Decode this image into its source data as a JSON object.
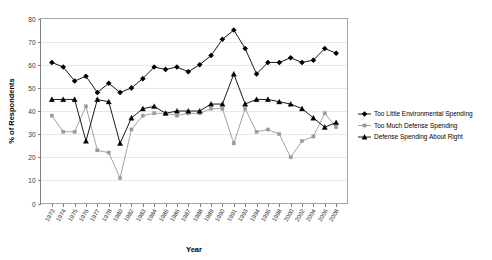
{
  "chart_data": {
    "type": "line",
    "title": "",
    "xlabel": "Year",
    "ylabel": "% of Respondents",
    "ylim": [
      0,
      80
    ],
    "yticks": [
      0,
      10,
      20,
      30,
      40,
      50,
      60,
      70,
      80
    ],
    "grid": true,
    "legend_position": "right",
    "categories": [
      "1973",
      "1974",
      "1975",
      "1976",
      "1977",
      "1978",
      "1980",
      "1982",
      "1983",
      "1984",
      "1985",
      "1986",
      "1987",
      "1988",
      "1989",
      "1990",
      "1991",
      "1993",
      "1994",
      "1996",
      "1998",
      "2000",
      "2002",
      "2004",
      "2006",
      "2008"
    ],
    "series": [
      {
        "name": "Too Little Environmental Spending",
        "marker": "diamond",
        "color": "#000000",
        "values": [
          61,
          59,
          53,
          55,
          48,
          52,
          48,
          50,
          54,
          59,
          58,
          59,
          57,
          60,
          64,
          71,
          75,
          67,
          56,
          61,
          61,
          63,
          61,
          62,
          67,
          65
        ]
      },
      {
        "name": "Too Much Defense Spending",
        "marker": "square",
        "color": "#999999",
        "values": [
          38,
          31,
          31,
          42,
          23,
          22,
          11,
          32,
          38,
          39,
          39,
          38,
          39,
          39,
          41,
          41,
          26,
          41,
          31,
          32,
          30,
          20,
          27,
          29,
          39,
          33
        ]
      },
      {
        "name": "Defense Spending About Right",
        "marker": "triangle",
        "color": "#000000",
        "values": [
          45,
          45,
          45,
          27,
          45,
          44,
          26,
          37,
          41,
          42,
          39,
          40,
          40,
          40,
          43,
          43,
          56,
          43,
          45,
          45,
          44,
          43,
          41,
          37,
          33,
          35
        ]
      }
    ]
  },
  "legend": {
    "items": [
      {
        "label": "Too Little Environmental Spending"
      },
      {
        "label": "Too Much Defense Spending"
      },
      {
        "label": "Defense Spending About Right"
      }
    ]
  },
  "axes": {
    "x_title": "Year",
    "y_title": "% of Respondents"
  }
}
